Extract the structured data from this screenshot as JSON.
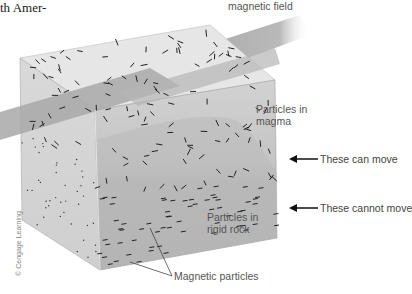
{
  "fragment_text": "th Amer-",
  "labels": {
    "field": "magnetic field",
    "magma": "Particles in magma",
    "magma_line1": "Particles in",
    "magma_line2": "magma",
    "rock_line1": "Particles in",
    "rock_line2": "rigid rock",
    "can_move": "These can move",
    "cannot_move": "These cannot move",
    "particles": "Magnetic particles"
  },
  "credit": "© Cengage Learning",
  "colors": {
    "top_face": "#e4e4e4",
    "front_face_upper": "#c9c9c9",
    "front_face_lower": "#b4b4b4",
    "side_face": "#d8d8d8",
    "field_band": "#a9a9a9",
    "particle": "#222222",
    "label_text": "#555555"
  }
}
